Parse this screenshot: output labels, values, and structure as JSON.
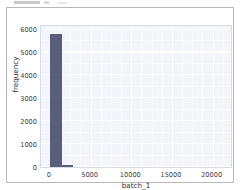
{
  "figure": {
    "style": "seaborn-whitegrid",
    "background_color": "#ffffff",
    "plot_background_color": "#f3f5fb",
    "grid_color": "#ffffff",
    "frame_color": "#b9b9b9",
    "bar_color": "#595e7c"
  },
  "chart_data": {
    "type": "bar",
    "title": "",
    "xlabel": "batch_1",
    "ylabel": "frequency",
    "xlim": [
      -1100,
      22500
    ],
    "ylim": [
      0,
      6250
    ],
    "grid": true,
    "legend": null,
    "xticks": [
      0,
      5000,
      10000,
      15000,
      20000
    ],
    "xtick_labels": [
      "0",
      "5000",
      "10000",
      "15000",
      "20000"
    ],
    "yticks": [
      0,
      1000,
      2000,
      3000,
      4000,
      5000,
      6000
    ],
    "ytick_labels": [
      "0",
      "1000",
      "2000",
      "3000",
      "4000",
      "5000",
      "6000"
    ],
    "categories": [
      "0-1450",
      "1450-2800"
    ],
    "bins": [
      {
        "left": 30,
        "right": 1450,
        "value": 5800
      },
      {
        "left": 1500,
        "right": 2800,
        "value": 95
      }
    ],
    "values": [
      5800,
      95
    ]
  }
}
